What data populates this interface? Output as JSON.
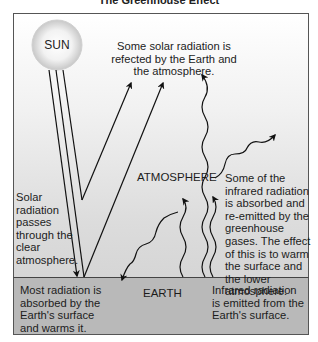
{
  "title": "The Greenhouse Effect",
  "labels": {
    "sun": "SUN",
    "reflected": "Some solar radiation is refected by the Earth and the atmosphere.",
    "atmosphere": "ATMOSPHERE",
    "passes": "Solar radiation passes through the clear atmosphere.",
    "absorbed_reemitted": "Some of the infrared radiation is absorbed and re-emitted by the greenhouse gases. The effect of this is to warm the surface and the lower atmosphere.",
    "earth": "EARTH",
    "absorbed_surface": "Most radiation is absorbed by the Earth's surface and warms it.",
    "infrared_emitted": "Infrared radiation is emitted from the Earth's surface."
  },
  "colors": {
    "sky_top": "#ffffff",
    "sky_bottom": "#cfcfcf",
    "earth": "#b9b9b9",
    "lines": "#111111"
  }
}
